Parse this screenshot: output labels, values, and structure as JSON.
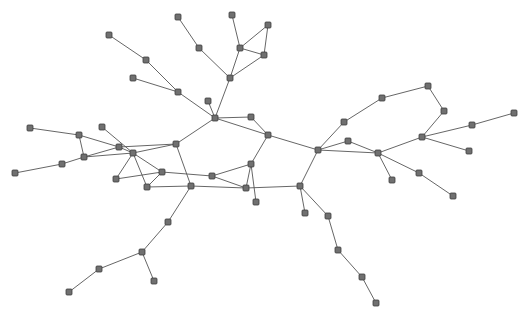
{
  "graph": {
    "type": "network",
    "style": {
      "node_fill": "#707070",
      "node_stroke": "#3c3c3c",
      "edge_color": "#555555",
      "node_size": 6,
      "node_shape": "square"
    },
    "nodes": [
      [
        109,
        35
      ],
      [
        146,
        60
      ],
      [
        133,
        78
      ],
      [
        178,
        92
      ],
      [
        178,
        17
      ],
      [
        199,
        48
      ],
      [
        232,
        15
      ],
      [
        240,
        48
      ],
      [
        268,
        25
      ],
      [
        264,
        55
      ],
      [
        230,
        78
      ],
      [
        208,
        101
      ],
      [
        215,
        118
      ],
      [
        251,
        117
      ],
      [
        268,
        135
      ],
      [
        176,
        144
      ],
      [
        251,
        164
      ],
      [
        212,
        176
      ],
      [
        191,
        186
      ],
      [
        246,
        188
      ],
      [
        256,
        202
      ],
      [
        30,
        128
      ],
      [
        79,
        135
      ],
      [
        102,
        127
      ],
      [
        119,
        147
      ],
      [
        84,
        157
      ],
      [
        62,
        164
      ],
      [
        15,
        173
      ],
      [
        133,
        153
      ],
      [
        162,
        172
      ],
      [
        116,
        179
      ],
      [
        147,
        187
      ],
      [
        168,
        222
      ],
      [
        142,
        252
      ],
      [
        99,
        269
      ],
      [
        69,
        292
      ],
      [
        154,
        281
      ],
      [
        318,
        150
      ],
      [
        344,
        122
      ],
      [
        382,
        98
      ],
      [
        428,
        86
      ],
      [
        444,
        111
      ],
      [
        422,
        137
      ],
      [
        472,
        125
      ],
      [
        514,
        113
      ],
      [
        469,
        151
      ],
      [
        348,
        141
      ],
      [
        378,
        153
      ],
      [
        392,
        180
      ],
      [
        419,
        173
      ],
      [
        453,
        196
      ],
      [
        300,
        186
      ],
      [
        305,
        213
      ],
      [
        328,
        216
      ],
      [
        338,
        250
      ],
      [
        362,
        277
      ],
      [
        376,
        303
      ]
    ],
    "edges": [
      [
        0,
        1
      ],
      [
        1,
        3
      ],
      [
        2,
        3
      ],
      [
        3,
        12
      ],
      [
        4,
        5
      ],
      [
        5,
        10
      ],
      [
        6,
        7
      ],
      [
        7,
        8
      ],
      [
        8,
        9
      ],
      [
        7,
        9
      ],
      [
        9,
        10
      ],
      [
        7,
        10
      ],
      [
        10,
        12
      ],
      [
        11,
        12
      ],
      [
        12,
        13
      ],
      [
        13,
        14
      ],
      [
        12,
        14
      ],
      [
        14,
        37
      ],
      [
        14,
        16
      ],
      [
        12,
        15
      ],
      [
        21,
        22
      ],
      [
        22,
        24
      ],
      [
        22,
        25
      ],
      [
        25,
        24
      ],
      [
        25,
        28
      ],
      [
        23,
        28
      ],
      [
        24,
        15
      ],
      [
        28,
        15
      ],
      [
        24,
        28
      ],
      [
        28,
        29
      ],
      [
        28,
        30
      ],
      [
        28,
        31
      ],
      [
        30,
        29
      ],
      [
        29,
        31
      ],
      [
        26,
        25
      ],
      [
        27,
        26
      ],
      [
        15,
        18
      ],
      [
        29,
        17
      ],
      [
        17,
        16
      ],
      [
        17,
        19
      ],
      [
        31,
        18
      ],
      [
        18,
        19
      ],
      [
        16,
        19
      ],
      [
        16,
        20
      ],
      [
        19,
        51
      ],
      [
        18,
        32
      ],
      [
        32,
        33
      ],
      [
        33,
        34
      ],
      [
        34,
        35
      ],
      [
        33,
        36
      ],
      [
        37,
        38
      ],
      [
        38,
        39
      ],
      [
        39,
        40
      ],
      [
        40,
        41
      ],
      [
        41,
        42
      ],
      [
        42,
        43
      ],
      [
        43,
        44
      ],
      [
        42,
        45
      ],
      [
        42,
        47
      ],
      [
        37,
        46
      ],
      [
        46,
        47
      ],
      [
        37,
        47
      ],
      [
        47,
        48
      ],
      [
        47,
        49
      ],
      [
        49,
        50
      ],
      [
        37,
        51
      ],
      [
        51,
        52
      ],
      [
        51,
        53
      ],
      [
        53,
        54
      ],
      [
        54,
        55
      ],
      [
        55,
        56
      ]
    ]
  }
}
